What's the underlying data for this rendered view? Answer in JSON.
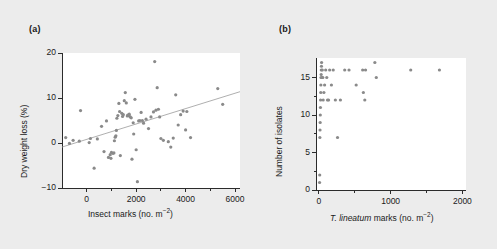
{
  "figure": {
    "background_color": "#ececec",
    "plot_background_color": "#ffffff",
    "point_color": "#8a8a8a",
    "axis_color": "#2b2b2b",
    "line_color": "#9a9a9a"
  },
  "panels": {
    "a": {
      "label": "(a)"
    },
    "b": {
      "label": "(b)"
    }
  },
  "chart_data": [
    {
      "type": "scatter",
      "panel": "(a)",
      "title": "",
      "xlabel_parts": {
        "pre": "Insect marks (no. m",
        "sup": "−2",
        "post": ")"
      },
      "xlabel": "Insect marks (no. m-2)",
      "ylabel": "Dry weight loss (%)",
      "xlim": [
        -1000,
        6200
      ],
      "ylim": [
        -10,
        20
      ],
      "xticks": [
        0,
        2000,
        4000,
        6000
      ],
      "xtick_labels": [
        "0",
        "2000",
        "4000",
        "6000"
      ],
      "xminorticks": [
        1000,
        3000,
        5000
      ],
      "yticks": [
        -10,
        0,
        10,
        20
      ],
      "ytick_labels": [
        "−10",
        "0",
        "10",
        "20"
      ],
      "grid": false,
      "legend": false,
      "trendline": {
        "x0": -1000,
        "y0": -0.9,
        "x1": 6200,
        "y1": 11.4
      },
      "points": [
        [
          -850,
          1.2
        ],
        [
          -700,
          -0.1
        ],
        [
          -550,
          0.6
        ],
        [
          -250,
          7.2
        ],
        [
          -300,
          0.4
        ],
        [
          100,
          0.1
        ],
        [
          150,
          1.0
        ],
        [
          300,
          -5.6
        ],
        [
          430,
          0.9
        ],
        [
          600,
          3.7
        ],
        [
          700,
          -1.9
        ],
        [
          800,
          4.9
        ],
        [
          880,
          -3.2
        ],
        [
          950,
          -2.6
        ],
        [
          980,
          -3.4
        ],
        [
          1000,
          -2.1
        ],
        [
          1060,
          -2.3
        ],
        [
          1100,
          -2.2
        ],
        [
          1120,
          0.5
        ],
        [
          1150,
          1.3
        ],
        [
          1180,
          1.6
        ],
        [
          1200,
          2.8
        ],
        [
          1220,
          5.5
        ],
        [
          1260,
          6.1
        ],
        [
          1300,
          8.8
        ],
        [
          1330,
          7.0
        ],
        [
          1360,
          -2.8
        ],
        [
          1420,
          6.6
        ],
        [
          1450,
          5.9
        ],
        [
          1480,
          6.3
        ],
        [
          1520,
          9.4
        ],
        [
          1560,
          11.2
        ],
        [
          1600,
          8.9
        ],
        [
          1640,
          6.0
        ],
        [
          1660,
          6.2
        ],
        [
          1700,
          6.1
        ],
        [
          1720,
          6.4
        ],
        [
          1760,
          5.8
        ],
        [
          1800,
          5.6
        ],
        [
          1830,
          -3.6
        ],
        [
          1880,
          4.5
        ],
        [
          1900,
          2.0
        ],
        [
          1950,
          9.7
        ],
        [
          2000,
          -1.5
        ],
        [
          2050,
          -8.6
        ],
        [
          2100,
          4.9
        ],
        [
          2150,
          5.0
        ],
        [
          2200,
          6.8
        ],
        [
          2250,
          5.0
        ],
        [
          2300,
          4.4
        ],
        [
          2400,
          5.3
        ],
        [
          2500,
          3.2
        ],
        [
          2600,
          5.8
        ],
        [
          2700,
          6.9
        ],
        [
          2750,
          18.1
        ],
        [
          2800,
          7.3
        ],
        [
          2850,
          12.3
        ],
        [
          2900,
          7.5
        ],
        [
          2950,
          5.8
        ],
        [
          3000,
          1.0
        ],
        [
          3100,
          0.6
        ],
        [
          3300,
          0.3
        ],
        [
          3400,
          -0.9
        ],
        [
          3500,
          1.1
        ],
        [
          3600,
          10.7
        ],
        [
          3700,
          4.0
        ],
        [
          3800,
          6.3
        ],
        [
          3900,
          7.1
        ],
        [
          4000,
          2.9
        ],
        [
          4050,
          7.0
        ],
        [
          4200,
          1.2
        ],
        [
          5300,
          12.1
        ],
        [
          5500,
          8.6
        ]
      ]
    },
    {
      "type": "scatter",
      "panel": "(b)",
      "title": "",
      "xlabel_parts": {
        "italic": "T. lineatum",
        "pre": " marks (no. m",
        "sup": "−2",
        "post": ")"
      },
      "xlabel": "T. lineatum marks (no. m-2)",
      "ylabel": "Number of isolates",
      "xlim": [
        -40,
        2050
      ],
      "ylim": [
        0,
        17.6
      ],
      "xticks": [
        0,
        1000,
        2000
      ],
      "xtick_labels": [
        "0",
        "1000",
        "2000"
      ],
      "xminorticks": [
        500,
        1500
      ],
      "yticks": [
        0,
        5,
        10,
        15
      ],
      "ytick_labels": [
        "0",
        "5",
        "10",
        "15"
      ],
      "yminorticks": [
        2.5,
        7.5,
        12.5
      ],
      "grid": false,
      "legend": false,
      "points": [
        [
          10,
          1
        ],
        [
          12,
          2
        ],
        [
          14,
          7
        ],
        [
          16,
          8
        ],
        [
          18,
          9
        ],
        [
          20,
          10
        ],
        [
          22,
          11
        ],
        [
          24,
          12
        ],
        [
          26,
          13
        ],
        [
          28,
          14
        ],
        [
          30,
          15
        ],
        [
          32,
          15.4
        ],
        [
          34,
          16
        ],
        [
          36,
          16.5
        ],
        [
          38,
          17
        ],
        [
          45,
          15
        ],
        [
          48,
          16
        ],
        [
          55,
          15
        ],
        [
          60,
          12
        ],
        [
          70,
          13
        ],
        [
          80,
          14
        ],
        [
          95,
          16
        ],
        [
          110,
          15
        ],
        [
          120,
          12
        ],
        [
          135,
          12
        ],
        [
          150,
          16
        ],
        [
          175,
          14
        ],
        [
          200,
          16
        ],
        [
          230,
          12
        ],
        [
          260,
          7
        ],
        [
          300,
          12
        ],
        [
          360,
          16
        ],
        [
          420,
          16
        ],
        [
          520,
          14
        ],
        [
          610,
          16
        ],
        [
          650,
          16
        ],
        [
          640,
          12
        ],
        [
          620,
          13
        ],
        [
          780,
          17
        ],
        [
          800,
          15
        ],
        [
          1280,
          16
        ],
        [
          1680,
          16
        ]
      ]
    }
  ]
}
